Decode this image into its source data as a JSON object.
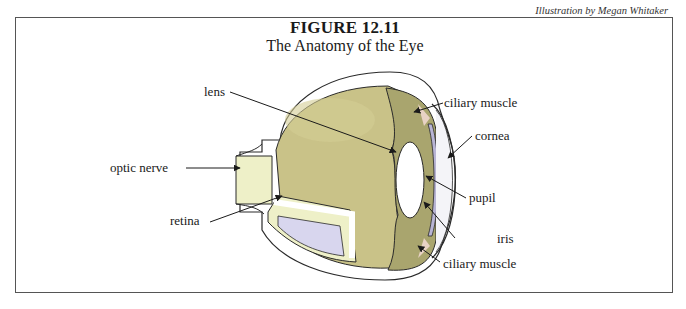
{
  "figure": {
    "title": "FIGURE 12.11",
    "subtitle": "The Anatomy of the Eye",
    "credit": "Illustration by Megan Whitaker"
  },
  "labels": {
    "lens": "lens",
    "optic_nerve": "optic nerve",
    "retina": "retina",
    "ciliary_muscle_top": "ciliary muscle",
    "cornea": "cornea",
    "pupil": "pupil",
    "iris": "iris",
    "ciliary_muscle_bottom": "ciliary muscle"
  },
  "colors": {
    "vitreous": "#c9c288",
    "vitreous_dark": "#a9a56e",
    "nerve": "#eef0c8",
    "sclera": "#ffffff",
    "choroid": "#d8d6ee",
    "lens": "#ffffff",
    "iris": "#b8b4d4",
    "ciliary": "#e8d2c4",
    "outline": "#2a2a2a",
    "frame": "#555555"
  }
}
